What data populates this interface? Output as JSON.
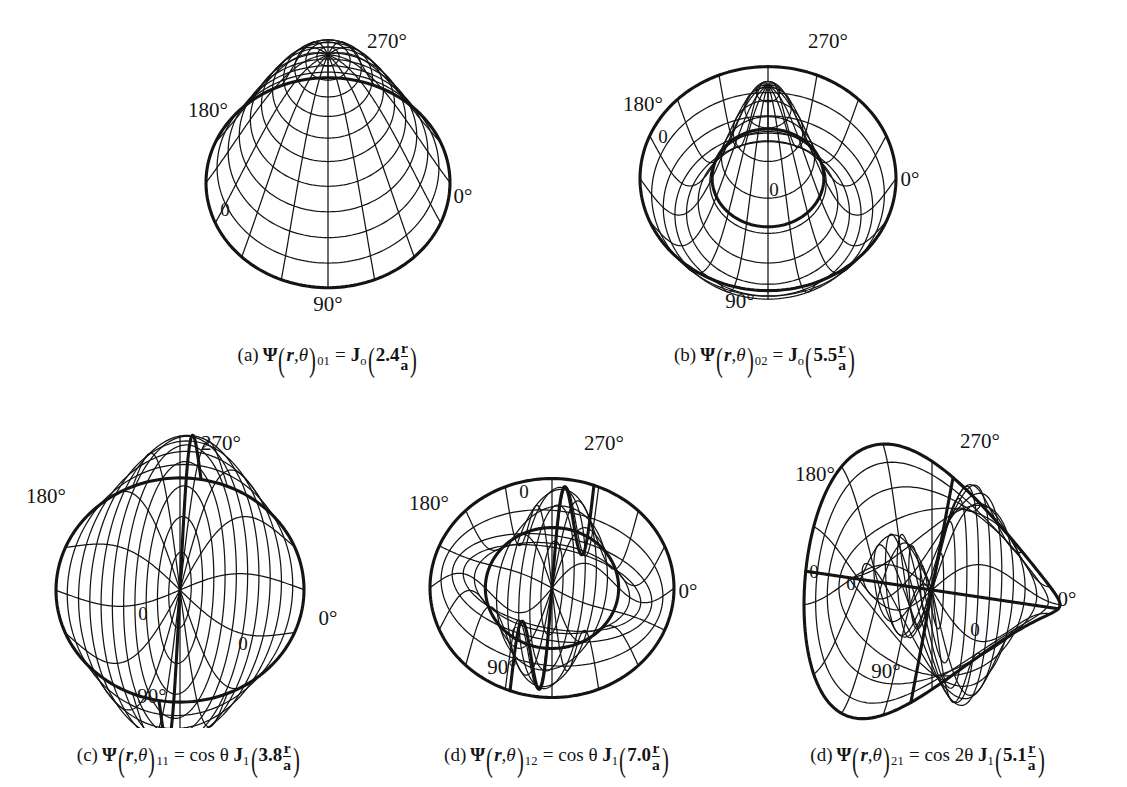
{
  "figure": {
    "background_color": "#ffffff",
    "line_color": "#141414",
    "panel_count": 5
  },
  "angle_labels": {
    "top": "270°",
    "left": "180°",
    "right": "0°",
    "bottom": "90°",
    "node_marker": "0"
  },
  "panels": [
    {
      "id": "panel-a",
      "caption_label": "(a)",
      "mode_m": 0,
      "mode_n": 1,
      "subscript": "01",
      "bessel_order": "o",
      "root": "2.4",
      "angular_factor": "",
      "radius_symbol_num": "r",
      "radius_symbol_den": "a",
      "nodal_circles": 0,
      "nodal_diameters": 0,
      "boundary_zero_labels": 1
    },
    {
      "id": "panel-b",
      "caption_label": "(b)",
      "mode_m": 0,
      "mode_n": 2,
      "subscript": "02",
      "bessel_order": "o",
      "root": "5.5",
      "angular_factor": "",
      "radius_symbol_num": "r",
      "radius_symbol_den": "a",
      "nodal_circles": 1,
      "nodal_diameters": 0,
      "boundary_zero_labels": 1
    },
    {
      "id": "panel-c",
      "caption_label": "(c)",
      "mode_m": 1,
      "mode_n": 1,
      "subscript": "11",
      "bessel_order": "1",
      "root": "3.8",
      "angular_factor": "cos θ",
      "radius_symbol_num": "r",
      "radius_symbol_den": "a",
      "nodal_circles": 0,
      "nodal_diameters": 1,
      "boundary_zero_labels": 2
    },
    {
      "id": "panel-d",
      "caption_label": "(d)",
      "mode_m": 1,
      "mode_n": 2,
      "subscript": "12",
      "bessel_order": "1",
      "root": "7.0",
      "angular_factor": "cos θ",
      "radius_symbol_num": "r",
      "radius_symbol_den": "a",
      "nodal_circles": 1,
      "nodal_diameters": 1,
      "boundary_zero_labels": 2
    },
    {
      "id": "panel-e",
      "caption_label": "(d)",
      "mode_m": 2,
      "mode_n": 1,
      "subscript": "21",
      "bessel_order": "1",
      "root": "5.1",
      "angular_factor": "cos 2θ",
      "radius_symbol_num": "r",
      "radius_symbol_den": "a",
      "nodal_circles": 0,
      "nodal_diameters": 2,
      "boundary_zero_labels": 2
    }
  ],
  "chart_data": {
    "type": "line",
    "xlabel": "",
    "ylabel": "",
    "axis_labels": [
      "270°",
      "180°",
      "0°",
      "90°"
    ],
    "legend": [],
    "grid": true,
    "projection": "polar-surface-mesh",
    "series": [
      {
        "name": "(a) Psi_01 = J0(2.4 r/a)",
        "m": 0,
        "n": 1,
        "root": 2.4,
        "nodal_circles": 0,
        "nodal_diameters": 0
      },
      {
        "name": "(b) Psi_02 = J0(5.5 r/a)",
        "m": 0,
        "n": 2,
        "root": 5.5,
        "nodal_circles": 1,
        "nodal_diameters": 0
      },
      {
        "name": "(c) Psi_11 = cos(theta) J1(3.8 r/a)",
        "m": 1,
        "n": 1,
        "root": 3.8,
        "nodal_circles": 0,
        "nodal_diameters": 1
      },
      {
        "name": "(d) Psi_12 = cos(theta) J1(7.0 r/a)",
        "m": 1,
        "n": 2,
        "root": 7.0,
        "nodal_circles": 1,
        "nodal_diameters": 1
      },
      {
        "name": "(d) Psi_21 = cos(2 theta) J1(5.1 r/a)",
        "m": 2,
        "n": 1,
        "root": 5.1,
        "nodal_circles": 0,
        "nodal_diameters": 2
      }
    ]
  }
}
